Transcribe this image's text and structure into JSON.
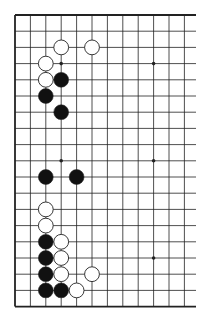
{
  "board": {
    "size": 19,
    "origin": {
      "x": 15,
      "y": 15
    },
    "spacing_x": 15.4,
    "spacing_y": 16.2,
    "visible_cols": 12,
    "line_extent_x": 196,
    "colors": {
      "line": "#222222",
      "black": "#111111",
      "white": "#ffffff",
      "background": "#ffffff"
    },
    "star_points": [
      [
        3,
        3
      ],
      [
        9,
        3
      ],
      [
        3,
        9
      ],
      [
        9,
        9
      ],
      [
        3,
        15
      ],
      [
        9,
        15
      ]
    ],
    "stones": [
      {
        "color": "white",
        "col": 3,
        "row": 2
      },
      {
        "color": "white",
        "col": 5,
        "row": 2
      },
      {
        "color": "white",
        "col": 2,
        "row": 3
      },
      {
        "color": "white",
        "col": 2,
        "row": 4
      },
      {
        "color": "black",
        "col": 3,
        "row": 4
      },
      {
        "color": "black",
        "col": 2,
        "row": 5
      },
      {
        "color": "black",
        "col": 3,
        "row": 6
      },
      {
        "color": "black",
        "col": 2,
        "row": 10
      },
      {
        "color": "black",
        "col": 4,
        "row": 10
      },
      {
        "color": "white",
        "col": 2,
        "row": 12
      },
      {
        "color": "white",
        "col": 2,
        "row": 13
      },
      {
        "color": "black",
        "col": 2,
        "row": 14
      },
      {
        "color": "white",
        "col": 3,
        "row": 14
      },
      {
        "color": "black",
        "col": 2,
        "row": 15
      },
      {
        "color": "white",
        "col": 3,
        "row": 15
      },
      {
        "color": "black",
        "col": 2,
        "row": 16
      },
      {
        "color": "white",
        "col": 3,
        "row": 16
      },
      {
        "color": "white",
        "col": 5,
        "row": 16
      },
      {
        "color": "black",
        "col": 2,
        "row": 17
      },
      {
        "color": "black",
        "col": 3,
        "row": 17
      },
      {
        "color": "white",
        "col": 4,
        "row": 17
      }
    ]
  }
}
